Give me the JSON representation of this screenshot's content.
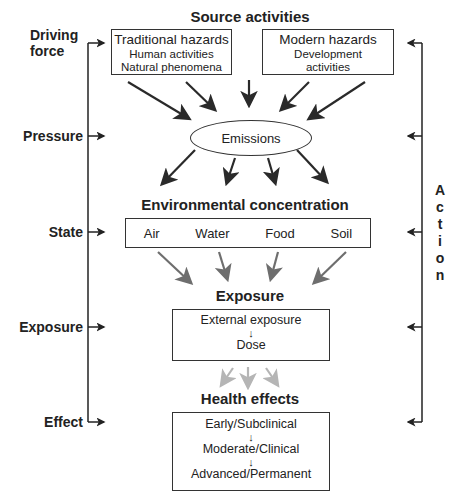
{
  "title": "Source activities",
  "stages": {
    "driving_force": "Driving force",
    "driving_force_l1": "Driving",
    "driving_force_l2": "force",
    "pressure": "Pressure",
    "state": "State",
    "exposure": "Exposure",
    "effect": "Effect"
  },
  "sources": {
    "traditional": {
      "title": "Traditional hazards",
      "items": [
        "Human activities",
        "Natural phenomena"
      ]
    },
    "modern": {
      "title": "Modern hazards",
      "items": [
        "Development",
        "activities"
      ]
    }
  },
  "emissions": "Emissions",
  "environmental_concentration": {
    "heading": "Environmental concentration",
    "media": [
      "Air",
      "Water",
      "Food",
      "Soil"
    ]
  },
  "exposure": {
    "heading": "Exposure",
    "steps": [
      "External exposure",
      "Dose"
    ]
  },
  "health_effects": {
    "heading": "Health effects",
    "steps": [
      "Early/Subclinical",
      "Moderate/Clinical",
      "Advanced/Permanent"
    ]
  },
  "action": {
    "label": "Action",
    "letters": [
      "A",
      "c",
      "t",
      "i",
      "o",
      "n"
    ]
  },
  "colors": {
    "line": "#222222",
    "arrow_dark": "#2a2a2a",
    "arrow_mid": "#6e6e6e",
    "arrow_light": "#b5b5b5"
  }
}
